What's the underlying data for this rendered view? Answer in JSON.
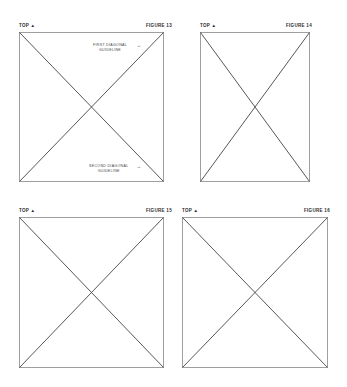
{
  "figures": [
    {
      "id": "fig13",
      "top_label": "TOP ▲",
      "figure_label": "FIGURE 13",
      "annotations": [
        {
          "line1": "FIRST DIAGONAL",
          "line2": "GUIDELINE",
          "arrow": "→"
        },
        {
          "line1": "SECOND DIAGONAL",
          "line2": "GUIDELINE",
          "arrow": "→"
        }
      ]
    },
    {
      "id": "fig14",
      "top_label": "TOP ▲",
      "figure_label": "FIGURE 14"
    },
    {
      "id": "fig15",
      "top_label": "TOP ▲",
      "figure_label": "FIGURE 15"
    },
    {
      "id": "fig16",
      "top_label": "TOP ▲",
      "figure_label": "FIGURE 16"
    }
  ],
  "colors": {
    "line": "#555555",
    "text": "#2a2a2a"
  }
}
